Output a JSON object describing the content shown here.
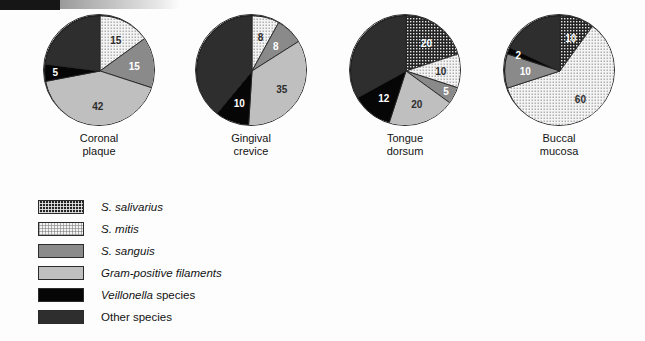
{
  "chart_data": [
    {
      "type": "pie",
      "title": "Coronal plaque",
      "caption_lines": [
        "Coronal",
        "plaque"
      ],
      "categories": [
        "S. salivarius",
        "S. mitis",
        "S. sanguis",
        "Gram-positive filaments",
        "Veillonella species",
        "Other species"
      ],
      "values": [
        0,
        15,
        15,
        42,
        5,
        23
      ],
      "labels": [
        "",
        "15",
        "15",
        "42",
        "5",
        ""
      ],
      "unit": "percent"
    },
    {
      "type": "pie",
      "title": "Gingival crevice",
      "caption_lines": [
        "Gingival",
        "crevice"
      ],
      "categories": [
        "S. salivarius",
        "S. mitis",
        "S. sanguis",
        "Gram-positive filaments",
        "Veillonella species",
        "Other species"
      ],
      "values": [
        0,
        8,
        8,
        35,
        10,
        39
      ],
      "labels": [
        "",
        "8",
        "8",
        "35",
        "10",
        ""
      ],
      "unit": "percent"
    },
    {
      "type": "pie",
      "title": "Tongue dorsum",
      "caption_lines": [
        "Tongue",
        "dorsum"
      ],
      "categories": [
        "S. salivarius",
        "S. mitis",
        "S. sanguis",
        "Gram-positive filaments",
        "Veillonella species",
        "Other species"
      ],
      "values": [
        20,
        10,
        5,
        20,
        12,
        33
      ],
      "labels": [
        "20",
        "10",
        "5",
        "20",
        "12",
        ""
      ],
      "unit": "percent"
    },
    {
      "type": "pie",
      "title": "Buccal mucosa",
      "caption_lines": [
        "Buccal",
        "mucosa"
      ],
      "categories": [
        "S. salivarius",
        "S. mitis",
        "S. sanguis",
        "Gram-positive filaments",
        "Veillonella species",
        "Other species"
      ],
      "values": [
        10,
        60,
        10,
        0,
        2,
        18
      ],
      "labels": [
        "10",
        "60",
        "10",
        "",
        "2",
        ""
      ],
      "unit": "percent"
    }
  ],
  "legend": {
    "position": "bottom-left",
    "items": [
      {
        "label": "S. salivarius",
        "italic_part": "S. salivarius",
        "plain_part": "",
        "fill": "f-salivarius",
        "color": "#242424",
        "pattern": "dark-checker"
      },
      {
        "label": "S. mitis",
        "italic_part": "S. mitis",
        "plain_part": "",
        "fill": "f-mitis",
        "color": "#f3f3f3",
        "pattern": "light-dot-screen"
      },
      {
        "label": "S. sanguis",
        "italic_part": "S. sanguis",
        "plain_part": "",
        "fill": "f-sanguis",
        "color": "#8a8a8a",
        "pattern": "solid"
      },
      {
        "label": "Gram-positive filaments",
        "italic_part": "Gram-positive filaments",
        "plain_part": "",
        "fill": "f-filaments",
        "color": "#bfbfbf",
        "pattern": "solid"
      },
      {
        "label": "Veillonella species",
        "italic_part": "Veillonella",
        "plain_part": " species",
        "fill": "f-veillonella",
        "color": "#060606",
        "pattern": "solid"
      },
      {
        "label": "Other species",
        "italic_part": "",
        "plain_part": "Other species",
        "fill": "f-other",
        "color": "#2e2e2e",
        "pattern": "solid"
      }
    ]
  },
  "bleed_text": ""
}
